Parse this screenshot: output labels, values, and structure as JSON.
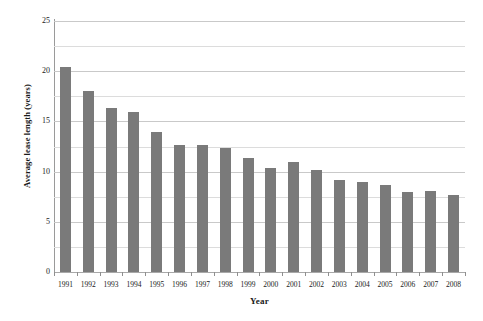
{
  "chart_data": {
    "type": "bar",
    "title": "",
    "xlabel": "Year",
    "ylabel": "Average lease length (years)",
    "categories": [
      "1991",
      "1992",
      "1993",
      "1994",
      "1995",
      "1996",
      "1997",
      "1998",
      "1999",
      "2000",
      "2001",
      "2002",
      "2003",
      "2004",
      "2005",
      "2006",
      "2007",
      "2008"
    ],
    "values": [
      20.4,
      18.0,
      16.3,
      15.9,
      13.9,
      12.7,
      12.7,
      12.4,
      11.4,
      10.4,
      11.0,
      10.2,
      9.2,
      9.0,
      8.7,
      8.0,
      8.1,
      7.7
    ],
    "ylim": [
      0,
      25
    ],
    "y_major_ticks": [
      "0",
      "5",
      "10",
      "15",
      "20",
      "25"
    ],
    "y_major_tick_values": [
      0,
      5,
      10,
      15,
      20,
      25
    ],
    "y_minor_tick_values": [
      2.5,
      7.5,
      12.5,
      17.5,
      22.5
    ],
    "grid": true,
    "legend": null,
    "bar_color": "#7a7a7a",
    "grid_color": "#c9c9c9",
    "axis_color": "#9a9a9a",
    "background": "#ffffff"
  }
}
